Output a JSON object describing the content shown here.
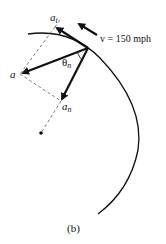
{
  "figure": {
    "caption": "(b)",
    "velocity_label": "v = 150 mph",
    "labels": {
      "a": "a",
      "a_t": "a",
      "a_t_sub": "t",
      "a_n": "a",
      "a_n_sub": "n",
      "theta": "θ",
      "theta_sub": "n"
    },
    "colors": {
      "ink": "#111111",
      "dashed": "#555555",
      "background": "#ffffff"
    }
  }
}
